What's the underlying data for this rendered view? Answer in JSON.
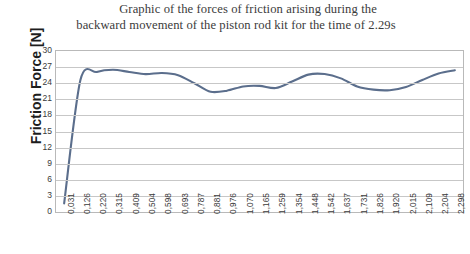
{
  "title": {
    "line1": "Graphic of the forces of friction arising during the",
    "line2": "backward movement of the piston rod kit for the time of 2.29s"
  },
  "axes": {
    "y_title": "Friction Force [N]"
  },
  "chart_data": {
    "type": "line",
    "title": "Graphic of the forces of friction arising during the backward movement of the piston rod kit for the time of 2.29s",
    "xlabel": "",
    "ylabel": "Friction Force [N]",
    "ylim": [
      0,
      30
    ],
    "y_ticks": [
      0,
      3,
      6,
      9,
      12,
      15,
      18,
      21,
      24,
      27,
      30
    ],
    "grid": true,
    "legend": "none",
    "line_color": "#5b6e8c",
    "categories": [
      "0,031",
      "0,126",
      "0,220",
      "0,315",
      "0,409",
      "0,504",
      "0,598",
      "0,693",
      "0,787",
      "0,881",
      "0,976",
      "1,070",
      "1,165",
      "1,259",
      "1,354",
      "1,448",
      "1,542",
      "1,637",
      "1,731",
      "1,826",
      "1,920",
      "2,015",
      "2,109",
      "2,204",
      "2,298"
    ],
    "values": [
      1.6,
      24.6,
      26.1,
      26.5,
      26.1,
      25.7,
      25.9,
      25.5,
      24.0,
      22.4,
      22.6,
      23.4,
      23.5,
      23.1,
      24.3,
      25.6,
      25.7,
      24.9,
      23.4,
      22.8,
      22.7,
      23.3,
      24.6,
      25.8,
      26.4
    ],
    "series": [
      {
        "name": "Friction force",
        "values": [
          1.6,
          24.6,
          26.1,
          26.5,
          26.1,
          25.7,
          25.9,
          25.5,
          24.0,
          22.4,
          22.6,
          23.4,
          23.5,
          23.1,
          24.3,
          25.6,
          25.7,
          24.9,
          23.4,
          22.8,
          22.7,
          23.3,
          24.6,
          25.8,
          26.4
        ]
      }
    ]
  }
}
